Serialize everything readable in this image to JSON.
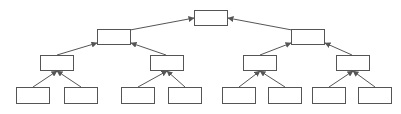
{
  "diagram": {
    "type": "tree",
    "direction": "child-to-parent arrows",
    "colors": {
      "stroke": "#555555",
      "fill": "#ffffff",
      "background": "#ffffff"
    },
    "nodes": [
      {
        "id": "n0",
        "level": 0,
        "x": 194,
        "y": 10,
        "w": 34,
        "h": 16,
        "label": ""
      },
      {
        "id": "n1",
        "level": 1,
        "x": 97,
        "y": 29,
        "w": 34,
        "h": 16,
        "label": ""
      },
      {
        "id": "n2",
        "level": 1,
        "x": 291,
        "y": 29,
        "w": 34,
        "h": 16,
        "label": ""
      },
      {
        "id": "n3",
        "level": 2,
        "x": 40,
        "y": 55,
        "w": 34,
        "h": 16,
        "label": ""
      },
      {
        "id": "n4",
        "level": 2,
        "x": 150,
        "y": 55,
        "w": 34,
        "h": 16,
        "label": ""
      },
      {
        "id": "n5",
        "level": 2,
        "x": 243,
        "y": 55,
        "w": 34,
        "h": 16,
        "label": ""
      },
      {
        "id": "n6",
        "level": 2,
        "x": 336,
        "y": 55,
        "w": 34,
        "h": 16,
        "label": ""
      },
      {
        "id": "n7",
        "level": 3,
        "x": 16,
        "y": 87,
        "w": 34,
        "h": 17,
        "label": ""
      },
      {
        "id": "n8",
        "level": 3,
        "x": 64,
        "y": 87,
        "w": 34,
        "h": 17,
        "label": ""
      },
      {
        "id": "n9",
        "level": 3,
        "x": 121,
        "y": 87,
        "w": 34,
        "h": 17,
        "label": ""
      },
      {
        "id": "n10",
        "level": 3,
        "x": 168,
        "y": 87,
        "w": 34,
        "h": 17,
        "label": ""
      },
      {
        "id": "n11",
        "level": 3,
        "x": 222,
        "y": 87,
        "w": 34,
        "h": 17,
        "label": ""
      },
      {
        "id": "n12",
        "level": 3,
        "x": 268,
        "y": 87,
        "w": 34,
        "h": 17,
        "label": ""
      },
      {
        "id": "n13",
        "level": 3,
        "x": 312,
        "y": 87,
        "w": 34,
        "h": 17,
        "label": ""
      },
      {
        "id": "n14",
        "level": 3,
        "x": 358,
        "y": 87,
        "w": 34,
        "h": 17,
        "label": ""
      }
    ],
    "edges": [
      {
        "from": "n1",
        "to": "n0",
        "x1": 130,
        "y1": 30,
        "x2": 194,
        "y2": 18
      },
      {
        "from": "n2",
        "to": "n0",
        "x1": 292,
        "y1": 30,
        "x2": 228,
        "y2": 18
      },
      {
        "from": "n3",
        "to": "n1",
        "x1": 57,
        "y1": 55,
        "x2": 97,
        "y2": 43
      },
      {
        "from": "n4",
        "to": "n1",
        "x1": 166,
        "y1": 55,
        "x2": 131,
        "y2": 43
      },
      {
        "from": "n5",
        "to": "n2",
        "x1": 260,
        "y1": 55,
        "x2": 291,
        "y2": 43
      },
      {
        "from": "n6",
        "to": "n2",
        "x1": 352,
        "y1": 55,
        "x2": 325,
        "y2": 43
      },
      {
        "from": "n7",
        "to": "n3",
        "x1": 33,
        "y1": 87,
        "x2": 57,
        "y2": 71
      },
      {
        "from": "n8",
        "to": "n3",
        "x1": 81,
        "y1": 87,
        "x2": 57,
        "y2": 71
      },
      {
        "from": "n9",
        "to": "n4",
        "x1": 138,
        "y1": 87,
        "x2": 167,
        "y2": 71
      },
      {
        "from": "n10",
        "to": "n4",
        "x1": 185,
        "y1": 87,
        "x2": 167,
        "y2": 71
      },
      {
        "from": "n11",
        "to": "n5",
        "x1": 239,
        "y1": 87,
        "x2": 260,
        "y2": 71
      },
      {
        "from": "n12",
        "to": "n5",
        "x1": 285,
        "y1": 87,
        "x2": 260,
        "y2": 71
      },
      {
        "from": "n13",
        "to": "n6",
        "x1": 329,
        "y1": 87,
        "x2": 353,
        "y2": 71
      },
      {
        "from": "n14",
        "to": "n6",
        "x1": 375,
        "y1": 87,
        "x2": 353,
        "y2": 71
      }
    ]
  }
}
